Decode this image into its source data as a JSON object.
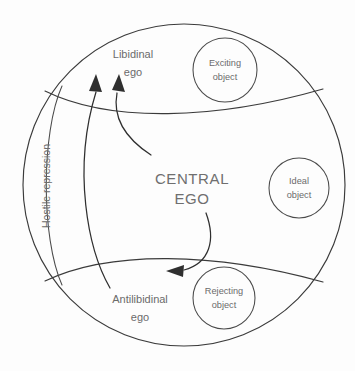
{
  "diagram": {
    "stroke_color": "#3b3b3b",
    "text_color": "#6b6b6b",
    "background_color": "#fdfdfd",
    "regions": [
      {
        "id": "libidinal",
        "label_line1": "Libidinal",
        "label_line2": "ego"
      },
      {
        "id": "central",
        "label_line1": "CENTRAL",
        "label_line2": "EGO"
      },
      {
        "id": "antilibidinal",
        "label_line1": "Antilibidinal",
        "label_line2": "ego"
      }
    ],
    "objects": [
      {
        "id": "exciting-object",
        "label_line1": "Exciting",
        "label_line2": "object"
      },
      {
        "id": "ideal-object",
        "label_line1": "Ideal",
        "label_line2": "object"
      },
      {
        "id": "rejecting-object",
        "label_line1": "Rejecting",
        "label_line2": "object"
      }
    ],
    "band": {
      "id": "hostile-repression",
      "label": "Hostile repression",
      "orientation": "vertical-rotated-270"
    },
    "arrows": [
      {
        "id": "arrow-long-to-libidinal",
        "from": "antilibidinal-ego",
        "to": "libidinal-ego",
        "direction": "up-left"
      },
      {
        "id": "arrow-central-to-libidinal",
        "from": "central-ego",
        "to": "libidinal-ego",
        "direction": "up-left"
      },
      {
        "id": "arrow-central-to-antilibidinal",
        "from": "central-ego",
        "to": "antilibidinal-ego",
        "direction": "down-left"
      }
    ]
  }
}
